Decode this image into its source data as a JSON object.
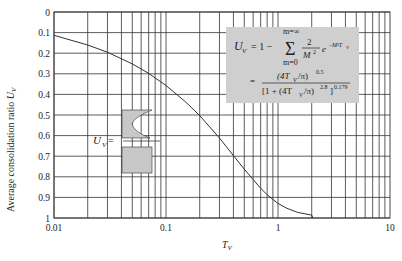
{
  "chart_data": {
    "type": "line",
    "title": "",
    "xlabel": "T_V",
    "ylabel": "Average consolidation ratio U_V",
    "xscale": "log",
    "xlim": [
      0.01,
      10
    ],
    "ylim": [
      0,
      1
    ],
    "y_inverted": true,
    "grid": true,
    "x_ticks": [
      "0.01",
      "0.1",
      "1",
      "10"
    ],
    "y_ticks": [
      "0",
      "0.1",
      "0.2",
      "0.3",
      "0.4",
      "0.5",
      "0.6",
      "0.7",
      "0.8",
      "0.9",
      "1"
    ],
    "series": [
      {
        "name": "U_V vs T_V",
        "x": [
          0.01,
          0.02,
          0.03,
          0.05,
          0.07,
          0.1,
          0.15,
          0.2,
          0.3,
          0.4,
          0.5,
          0.6,
          0.7,
          0.8,
          1.0,
          1.2,
          1.5,
          2.0
        ],
        "y": [
          0.113,
          0.16,
          0.195,
          0.252,
          0.298,
          0.357,
          0.437,
          0.503,
          0.611,
          0.697,
          0.763,
          0.814,
          0.856,
          0.887,
          0.929,
          0.953,
          0.973,
          0.986
        ]
      }
    ],
    "annotations": {
      "formula_line1_lhs": "U",
      "formula_line1_lhs_sub": "V",
      "formula_line1_eq": "= 1 −",
      "sum_upper": "m=∞",
      "sum_lower": "m=0",
      "sum_symbol": "Σ",
      "frac_num": "2",
      "frac_den": "M",
      "frac_den_sup": "2",
      "exp_term": "e",
      "exp_sup": "−M²T",
      "exp_sup_sub": "V",
      "formula_line2_eq": "=",
      "frac2_num": "(4T",
      "frac2_num_sub": "V",
      "frac2_num_tail": "/π)",
      "frac2_num_sup": "0.5",
      "frac2_den": "[1 + (4T",
      "frac2_den_sub": "V",
      "frac2_den_tail": "/π)",
      "frac2_den_sup": "2.8",
      "frac2_den_close": "]",
      "frac2_den_outer_sup": "0.179",
      "inset_label": "U",
      "inset_label_sub": "V",
      "inset_label_eq": "="
    }
  },
  "colors": {
    "grid": "#333333",
    "curve": "#333333",
    "formula_box": "#cfcfcf",
    "inset_fill": "#c8c8c8"
  }
}
